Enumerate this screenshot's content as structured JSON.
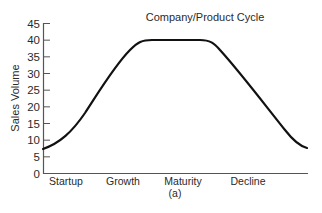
{
  "chart_data": {
    "type": "line",
    "title": "Company/Product Cycle",
    "subtitle": "",
    "caption": "(a)",
    "xlabel": "",
    "ylabel": "Sales Volume",
    "ylim": [
      0,
      45
    ],
    "yticks": [
      0,
      5,
      10,
      15,
      20,
      25,
      30,
      35,
      40,
      45
    ],
    "categories": [
      "Startup",
      "Growth",
      "Maturity",
      "Decline"
    ],
    "grid": false,
    "legend": null,
    "series": [
      {
        "name": "Sales Volume",
        "x": [
          0,
          0.1,
          0.2,
          0.3,
          0.38,
          0.45,
          0.55,
          0.62,
          0.7,
          0.8,
          0.9,
          1.0
        ],
        "values": [
          5,
          9,
          16,
          26,
          35,
          39.7,
          40,
          39.5,
          33,
          22,
          12,
          5.5
        ]
      }
    ]
  }
}
